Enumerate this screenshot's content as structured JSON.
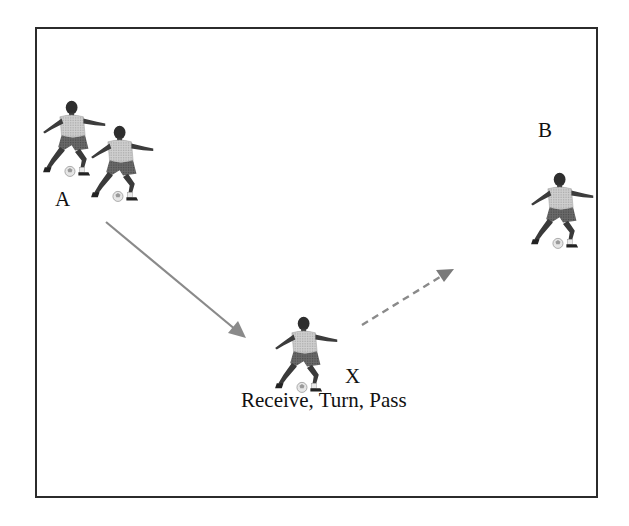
{
  "diagram": {
    "labels": {
      "a": "A",
      "b": "B",
      "x": "X",
      "caption": "Receive, Turn, Pass"
    },
    "nodes": [
      {
        "id": "A",
        "label": "A",
        "players": 2,
        "position": "top-left"
      },
      {
        "id": "B",
        "label": "B",
        "players": 1,
        "position": "right"
      },
      {
        "id": "X",
        "label": "X",
        "players": 1,
        "position": "bottom-center"
      }
    ],
    "edges": [
      {
        "from": "A",
        "to": "X",
        "style": "solid",
        "color": "#8a8a8a",
        "meaning": "pass"
      },
      {
        "from": "X",
        "to": "B",
        "style": "dashed",
        "color": "#8a8a8a",
        "meaning": "pass after turn"
      }
    ],
    "colors": {
      "border": "#2b2b2b",
      "arrow": "#8a8a8a",
      "background": "#ffffff",
      "text": "#111111"
    }
  }
}
